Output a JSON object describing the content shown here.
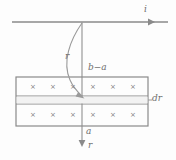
{
  "figure": {
    "background_color": "#fdfdfd",
    "stroke_color": "#8a8a8a",
    "label_color": "#6e6e6e",
    "width": 176,
    "height": 160
  },
  "labels": {
    "current": "i",
    "radius_upper": "r",
    "thickness": "b−a",
    "differential": "dr",
    "inner_radius": "a",
    "radius_axis": "r"
  },
  "field_symbol": {
    "glyph": "×",
    "meaning": "magnetic-field-into-page",
    "top_row_count": 6,
    "bottom_row_count": 6,
    "top_row_y": 87,
    "bottom_row_y": 115,
    "x_positions": [
      33,
      53,
      73,
      93,
      113,
      133
    ]
  },
  "geometry": {
    "wire_line": {
      "x1": 12,
      "y1": 22,
      "x2": 168,
      "y2": 22
    },
    "current_arrow_x": 150,
    "vertical_axis": {
      "x": 82,
      "y_top": 22,
      "y_bottom": 146
    },
    "slab_rect": {
      "x": 16,
      "y": 77,
      "width": 132,
      "height": 49
    },
    "dr_strip": {
      "y_top": 96,
      "y_bottom": 104
    },
    "curve_arrow": {
      "start_x": 82,
      "start_y": 23,
      "end_x": 83,
      "end_y": 97
    }
  }
}
